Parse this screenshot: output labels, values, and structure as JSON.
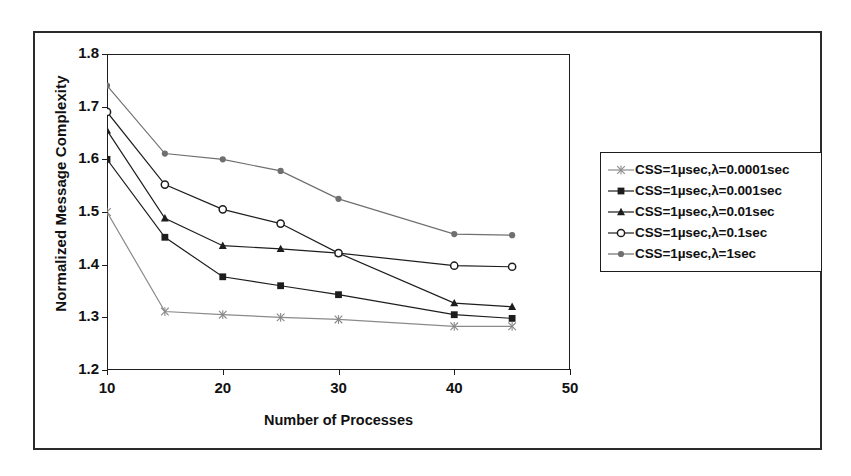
{
  "chart_data": {
    "type": "line",
    "title": "",
    "xlabel": "Number of Processes",
    "ylabel": "Normalized Message Complexity",
    "xlim": [
      10,
      50
    ],
    "ylim": [
      1.2,
      1.8
    ],
    "xticks": [
      "10",
      "20",
      "30",
      "40",
      "50"
    ],
    "xtick_values": [
      10,
      20,
      30,
      40,
      50
    ],
    "yticks": [
      "1.2",
      "1.3",
      "1.4",
      "1.5",
      "1.6",
      "1.7",
      "1.8"
    ],
    "ytick_values": [
      1.2,
      1.3,
      1.4,
      1.5,
      1.6,
      1.7,
      1.8
    ],
    "grid": false,
    "legend_position": "right-outside",
    "x": [
      10,
      15,
      20,
      25,
      30,
      40,
      45
    ],
    "series": [
      {
        "name": "CSS=1µsec,λ=0.0001sec",
        "marker": "star",
        "values": [
          1.5,
          1.311,
          1.305,
          1.3,
          1.296,
          1.283,
          1.283
        ]
      },
      {
        "name": "CSS=1µsec,λ=0.001sec",
        "marker": "filled-square",
        "values": [
          1.6,
          1.452,
          1.377,
          1.36,
          1.343,
          1.305,
          1.298
        ]
      },
      {
        "name": "CSS=1µsec,λ=0.01sec",
        "marker": "filled-triangle",
        "values": [
          1.655,
          1.488,
          1.436,
          1.43,
          1.422,
          1.327,
          1.32
        ]
      },
      {
        "name": "CSS=1µsec,λ=0.1sec",
        "marker": "open-circle",
        "values": [
          1.69,
          1.552,
          1.505,
          1.478,
          1.422,
          1.398,
          1.396
        ]
      },
      {
        "name": "CSS=1µsec,λ=1sec",
        "marker": "filled-circle",
        "values": [
          1.74,
          1.611,
          1.6,
          1.578,
          1.525,
          1.458,
          1.456
        ]
      }
    ]
  },
  "colors": {
    "axis": "#1d1d1d",
    "frame": "#2b2b2b",
    "series_0": "#8a8a8a",
    "series_1": "#1d1d1d",
    "series_2": "#1d1d1d",
    "series_3": "#1d1d1d",
    "series_4": "#6f6f6f"
  },
  "legend": {
    "items": [
      {
        "label": "CSS=1µsec,λ=0.0001sec",
        "marker": "star"
      },
      {
        "label": "CSS=1µsec,λ=0.001sec",
        "marker": "filled-square"
      },
      {
        "label": "CSS=1µsec,λ=0.01sec",
        "marker": "filled-triangle"
      },
      {
        "label": "CSS=1µsec,λ=0.1sec",
        "marker": "open-circle"
      },
      {
        "label": "CSS=1µsec,λ=1sec",
        "marker": "filled-circle"
      }
    ]
  }
}
